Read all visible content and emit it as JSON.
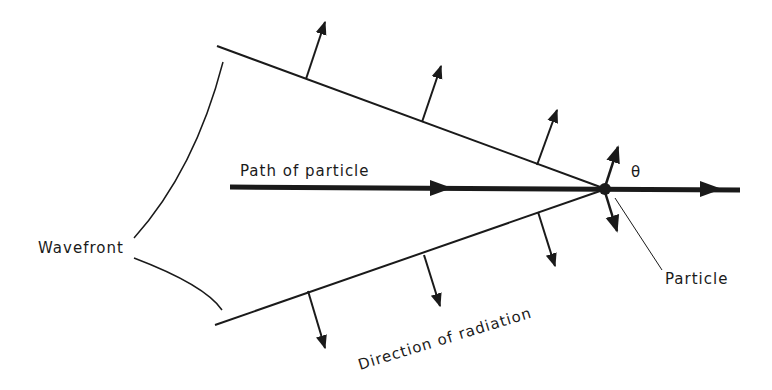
{
  "diagram": {
    "labels": {
      "path": "Path of particle",
      "wavefront": "Wavefront",
      "particle": "Particle",
      "direction": "Direction of radiation",
      "angle": "θ"
    },
    "colors": {
      "ink": "#1a1a1a",
      "background": "#ffffff"
    }
  }
}
